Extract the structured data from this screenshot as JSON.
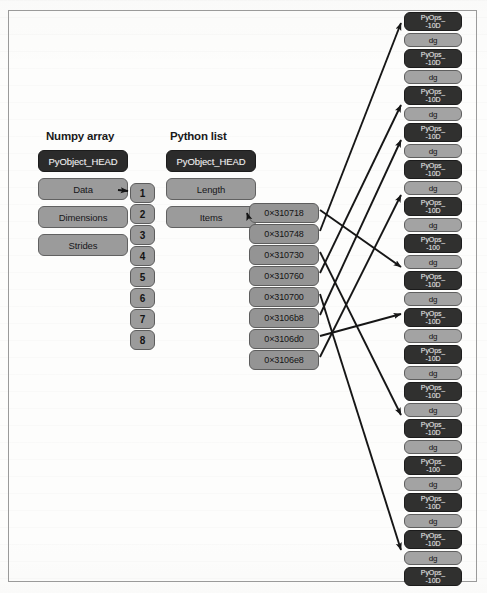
{
  "figure": {
    "background_color": "#fdfdfc",
    "border_color": "#9a9a9a",
    "dark_box_color": "#2b2b2b",
    "gray_box_color": "#9b9b9b",
    "arrow_color": "#1a1a1a"
  },
  "numpy_array": {
    "title": "Numpy array",
    "fields": [
      {
        "label": "PyObject_HEAD",
        "style": "dark"
      },
      {
        "label": "Data",
        "style": "gray"
      },
      {
        "label": "Dimensions",
        "style": "gray"
      },
      {
        "label": "Strides",
        "style": "gray"
      }
    ]
  },
  "python_list": {
    "title": "Python list",
    "fields": [
      {
        "label": "PyObject_HEAD",
        "style": "dark"
      },
      {
        "label": "Length",
        "style": "gray"
      },
      {
        "label": "Items",
        "style": "gray"
      }
    ]
  },
  "data_buffer": {
    "values": [
      "1",
      "2",
      "3",
      "4",
      "5",
      "6",
      "7",
      "8"
    ]
  },
  "pointer_table": {
    "addresses": [
      "0×310718",
      "0×310748",
      "0×310730",
      "0×310760",
      "0×310700",
      "0×3106b8",
      "0×3106d0",
      "0×3106e8"
    ]
  },
  "pyobject_heap": {
    "rows": [
      {
        "head": "PyOps_",
        "head2": "-10D",
        "value": "dg"
      },
      {
        "head": "PyOps_",
        "head2": "-10D",
        "value": "dg"
      },
      {
        "head": "PyOps_",
        "head2": "-10D",
        "value": "dg"
      },
      {
        "head": "PyOps_",
        "head2": "-10D",
        "value": "dg"
      },
      {
        "head": "PyOps_",
        "head2": "-10D",
        "value": "dg"
      },
      {
        "head": "PyOps_",
        "head2": "-10D",
        "value": "dg"
      },
      {
        "head": "PyOps_",
        "head2": "-100",
        "value": "dg"
      },
      {
        "head": "PyOps_",
        "head2": "-10D",
        "value": "dg"
      },
      {
        "head": "PyOps_",
        "head2": "-10D",
        "value": "dg"
      },
      {
        "head": "PyOps_",
        "head2": "-10D",
        "value": "dg"
      },
      {
        "head": "PyOps_",
        "head2": "-10D",
        "value": "dg"
      },
      {
        "head": "PyOps_",
        "head2": "-10D",
        "value": "dg"
      },
      {
        "head": "PyOps_",
        "head2": "-100",
        "value": "dg"
      },
      {
        "head": "PyOps_",
        "head2": "-10D",
        "value": "dg"
      },
      {
        "head": "PyOps_",
        "head2": "-10D",
        "value": "dg"
      },
      {
        "head": "PyOps_",
        "head2": "-10D",
        "value": "dg"
      }
    ]
  }
}
